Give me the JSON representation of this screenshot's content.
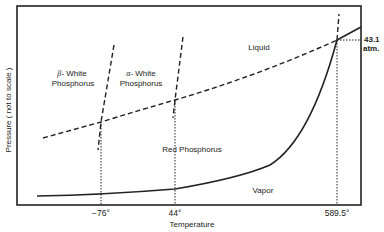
{
  "diagram": {
    "axes": {
      "xlabel": "Temperature",
      "ylabel": "Pressure ( not to scale )"
    },
    "x_ticks": [
      {
        "label": "−76°"
      },
      {
        "label": "44°"
      },
      {
        "label": "589.5°"
      }
    ],
    "triple_point_pressure": {
      "line1": "43.1",
      "line2": "atm."
    },
    "regions": {
      "beta_white": {
        "symbol": "β",
        "line1": "- White",
        "line2": "Phosphorus"
      },
      "alpha_white": {
        "symbol": "α",
        "line1": "- White",
        "line2": "Phosphorus"
      },
      "liquid": "Liquid",
      "red": "Red Phosphorus",
      "vapor": "Vapor"
    },
    "colors": {
      "ink": "#222222",
      "background": "#ffffff"
    }
  }
}
